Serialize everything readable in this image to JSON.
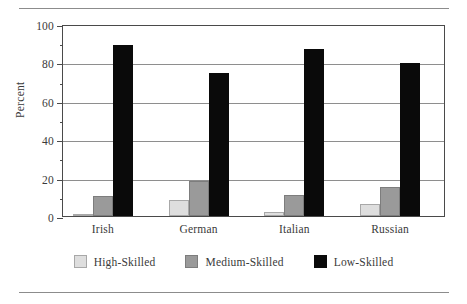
{
  "chart_data": {
    "type": "bar",
    "title": "",
    "subtitle": "",
    "xlabel": "",
    "ylabel": "Percent",
    "categories": [
      "Irish",
      "German",
      "Italian",
      "Russian"
    ],
    "series": [
      {
        "name": "High-Skilled",
        "color": "#dedede",
        "values": [
          1,
          8.5,
          2,
          6
        ]
      },
      {
        "name": "Medium-Skilled",
        "color": "#9a9a9a",
        "values": [
          10.5,
          18,
          11,
          15
        ]
      },
      {
        "name": "Low-Skilled",
        "color": "#0a0a0a",
        "values": [
          89,
          74.5,
          87,
          79.5
        ]
      }
    ],
    "ylim": [
      0,
      100
    ],
    "y_major_ticks": [
      0,
      20,
      40,
      60,
      80,
      100
    ],
    "y_minor_ticks": [
      10,
      30,
      50,
      70,
      90
    ],
    "y_tick_labels": [
      "0",
      "20",
      "40",
      "60",
      "80",
      "100"
    ],
    "grid": "horizontal-major",
    "legend_position": "bottom-center",
    "grouped": true,
    "frame": true,
    "rules": {
      "top": true,
      "bottom": true
    }
  }
}
